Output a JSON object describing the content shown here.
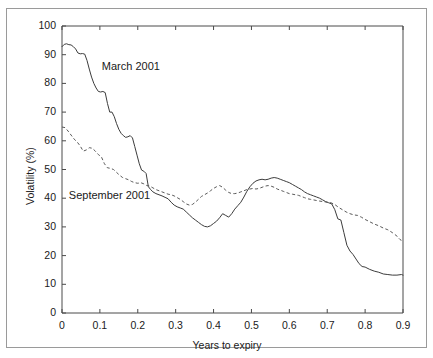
{
  "chart_data": {
    "type": "line",
    "title": "",
    "xlabel": "Years to expiry",
    "ylabel": "Volatility (%)",
    "xlim": [
      0,
      0.9
    ],
    "ylim": [
      0,
      100
    ],
    "grid": false,
    "legend_position": "inline-annotations",
    "xticks": [
      "0",
      "0.1",
      "0.2",
      "0.3",
      "0.4",
      "0.5",
      "0.6",
      "0.7",
      "0.8",
      "0.9"
    ],
    "xtick_values": [
      0,
      0.1,
      0.2,
      0.3,
      0.4,
      0.5,
      0.6,
      0.7,
      0.8,
      0.9
    ],
    "yticks": [
      "0",
      "10",
      "20",
      "30",
      "40",
      "50",
      "60",
      "70",
      "80",
      "90",
      "100"
    ],
    "ytick_values": [
      0,
      10,
      20,
      30,
      40,
      50,
      60,
      70,
      80,
      90,
      100
    ],
    "annotations": [
      {
        "text": "March 2001",
        "x": 0.105,
        "y": 85.5
      },
      {
        "text": "September 2001",
        "x": 0.018,
        "y": 40.5
      }
    ],
    "series": [
      {
        "name": "March 2001",
        "style": "solid",
        "color": "#3c3c3c",
        "x": [
          0.0,
          0.006,
          0.012,
          0.018,
          0.024,
          0.03,
          0.036,
          0.042,
          0.048,
          0.054,
          0.06,
          0.066,
          0.072,
          0.078,
          0.084,
          0.09,
          0.096,
          0.102,
          0.108,
          0.114,
          0.12,
          0.126,
          0.132,
          0.138,
          0.144,
          0.15,
          0.156,
          0.162,
          0.168,
          0.174,
          0.18,
          0.186,
          0.192,
          0.198,
          0.204,
          0.21,
          0.216,
          0.222,
          0.228,
          0.234,
          0.24,
          0.248,
          0.256,
          0.264,
          0.272,
          0.28,
          0.288,
          0.296,
          0.304,
          0.312,
          0.32,
          0.328,
          0.336,
          0.344,
          0.352,
          0.36,
          0.368,
          0.376,
          0.384,
          0.392,
          0.4,
          0.408,
          0.416,
          0.424,
          0.432,
          0.44,
          0.448,
          0.456,
          0.464,
          0.472,
          0.48,
          0.488,
          0.496,
          0.504,
          0.512,
          0.52,
          0.528,
          0.536,
          0.544,
          0.552,
          0.56,
          0.568,
          0.576,
          0.584,
          0.592,
          0.6,
          0.608,
          0.616,
          0.624,
          0.632,
          0.64,
          0.648,
          0.656,
          0.664,
          0.672,
          0.68,
          0.688,
          0.696,
          0.704,
          0.712,
          0.72,
          0.728,
          0.736,
          0.744,
          0.752,
          0.76,
          0.768,
          0.776,
          0.784,
          0.792,
          0.8,
          0.812,
          0.824,
          0.836,
          0.848,
          0.86,
          0.872,
          0.884,
          0.896,
          0.9
        ],
        "y": [
          92.8,
          93.6,
          93.8,
          93.5,
          93.4,
          92.8,
          92.0,
          90.6,
          90.3,
          90.4,
          90.2,
          88.0,
          85.0,
          82.2,
          80.0,
          78.4,
          77.2,
          77.0,
          77.2,
          76.8,
          73.0,
          70.0,
          70.0,
          68.4,
          66.0,
          64.0,
          62.6,
          61.8,
          61.2,
          61.4,
          61.8,
          61.0,
          58.0,
          55.0,
          52.0,
          49.8,
          49.4,
          48.6,
          44.0,
          43.0,
          42.2,
          41.6,
          41.2,
          40.8,
          40.3,
          39.8,
          38.6,
          37.6,
          37.0,
          36.6,
          36.2,
          35.2,
          34.2,
          33.2,
          32.4,
          31.6,
          30.8,
          30.2,
          30.0,
          30.4,
          31.2,
          32.0,
          33.2,
          34.6,
          34.0,
          33.4,
          34.6,
          36.2,
          37.4,
          38.6,
          40.4,
          42.4,
          44.0,
          45.2,
          46.0,
          46.4,
          46.6,
          46.4,
          46.6,
          47.0,
          47.2,
          47.0,
          46.6,
          46.2,
          45.8,
          45.4,
          44.8,
          44.2,
          43.6,
          43.0,
          42.2,
          41.6,
          41.2,
          40.8,
          40.4,
          40.0,
          39.4,
          38.8,
          38.4,
          38.0,
          36.0,
          32.8,
          32.4,
          28.0,
          23.6,
          21.6,
          20.4,
          18.8,
          17.2,
          16.2,
          16.0,
          15.2,
          14.6,
          14.2,
          13.6,
          13.4,
          13.2,
          13.2,
          13.4,
          13.2
        ]
      },
      {
        "name": "September 2001",
        "style": "dashed",
        "color": "#5a5a5a",
        "x": [
          0.0,
          0.008,
          0.016,
          0.024,
          0.032,
          0.04,
          0.048,
          0.056,
          0.064,
          0.072,
          0.08,
          0.088,
          0.096,
          0.104,
          0.112,
          0.12,
          0.128,
          0.136,
          0.144,
          0.152,
          0.16,
          0.168,
          0.176,
          0.184,
          0.192,
          0.2,
          0.208,
          0.216,
          0.224,
          0.232,
          0.24,
          0.248,
          0.256,
          0.264,
          0.272,
          0.28,
          0.288,
          0.296,
          0.304,
          0.312,
          0.32,
          0.328,
          0.336,
          0.344,
          0.352,
          0.36,
          0.368,
          0.376,
          0.384,
          0.392,
          0.4,
          0.408,
          0.416,
          0.424,
          0.432,
          0.44,
          0.448,
          0.456,
          0.464,
          0.472,
          0.48,
          0.488,
          0.496,
          0.504,
          0.512,
          0.52,
          0.528,
          0.536,
          0.544,
          0.552,
          0.56,
          0.568,
          0.576,
          0.584,
          0.592,
          0.6,
          0.608,
          0.616,
          0.624,
          0.632,
          0.64,
          0.648,
          0.656,
          0.664,
          0.672,
          0.68,
          0.69,
          0.7,
          0.71,
          0.72,
          0.73,
          0.74,
          0.75,
          0.76,
          0.77,
          0.78,
          0.79,
          0.8,
          0.812,
          0.824,
          0.836,
          0.848,
          0.86,
          0.872,
          0.884,
          0.892,
          0.9
        ],
        "y": [
          64.8,
          64.6,
          63.4,
          62.0,
          60.6,
          59.6,
          58.2,
          56.4,
          56.8,
          57.6,
          57.4,
          56.4,
          55.2,
          54.4,
          52.0,
          50.6,
          50.4,
          50.0,
          49.0,
          48.0,
          47.2,
          46.8,
          46.4,
          45.8,
          45.4,
          45.2,
          45.4,
          45.0,
          44.4,
          44.2,
          43.6,
          43.0,
          42.6,
          42.2,
          41.8,
          41.4,
          41.2,
          40.8,
          40.2,
          39.6,
          38.8,
          38.0,
          37.6,
          37.8,
          38.6,
          39.6,
          40.6,
          41.2,
          41.8,
          42.6,
          43.4,
          44.0,
          44.4,
          43.8,
          42.8,
          42.0,
          41.6,
          41.6,
          41.8,
          42.2,
          42.6,
          43.0,
          43.2,
          43.4,
          43.2,
          43.4,
          43.8,
          44.2,
          44.4,
          44.2,
          43.8,
          43.2,
          42.8,
          42.4,
          42.0,
          41.6,
          41.4,
          41.2,
          41.0,
          40.6,
          40.2,
          39.8,
          39.6,
          39.4,
          39.2,
          39.0,
          38.8,
          38.6,
          38.4,
          37.8,
          36.8,
          36.0,
          35.2,
          34.6,
          34.2,
          34.0,
          33.4,
          32.6,
          31.8,
          31.0,
          30.4,
          29.6,
          29.0,
          28.0,
          26.8,
          25.6,
          25.0
        ]
      }
    ]
  }
}
